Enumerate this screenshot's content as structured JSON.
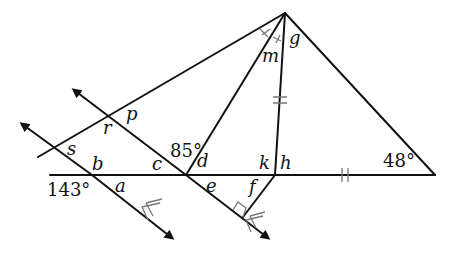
{
  "diagram": {
    "type": "geometry",
    "given_angles": {
      "angle_143": "143°",
      "angle_85": "85°",
      "angle_48": "48°"
    },
    "variable_labels": {
      "a": "a",
      "b": "b",
      "c": "c",
      "d": "d",
      "e": "e",
      "f": "f",
      "g": "g",
      "h": "h",
      "k": "k",
      "m": "m",
      "p": "p",
      "r": "r",
      "s": "s"
    },
    "marks": {
      "parallel_arrows": "double chevrons on both transversal lines (parallel)",
      "congruent_segments": "double tick on cevian to h and on base segment between h and right vertex",
      "congruent_angles": "single tick marks on two angles at apex (angle bisector)",
      "right_angle": "right-angle box at foot of segment from h onto right transversal"
    },
    "colors": {
      "line": "#111111",
      "mark": "#777777",
      "background": "#ffffff"
    }
  }
}
